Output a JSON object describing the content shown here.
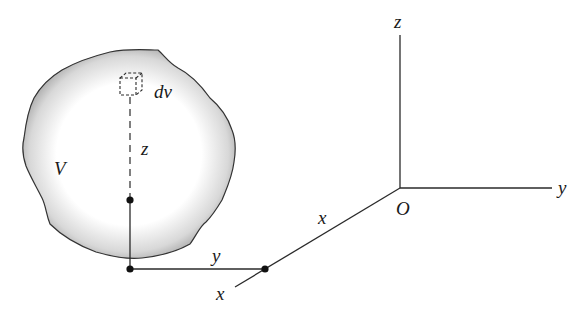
{
  "diagram": {
    "body": {
      "label": "V",
      "fill_edge": "#9a9a9a",
      "fill_center": "#ffffff",
      "outline": "#333333"
    },
    "element": {
      "label": "dv"
    },
    "axes": {
      "origin_label": "O",
      "x_label": "x",
      "y_label": "y",
      "z_label": "z"
    },
    "coordinate_labels": {
      "z_distance": "z",
      "y_distance": "y",
      "x_distance": "x",
      "x_axis_end": "x"
    }
  }
}
